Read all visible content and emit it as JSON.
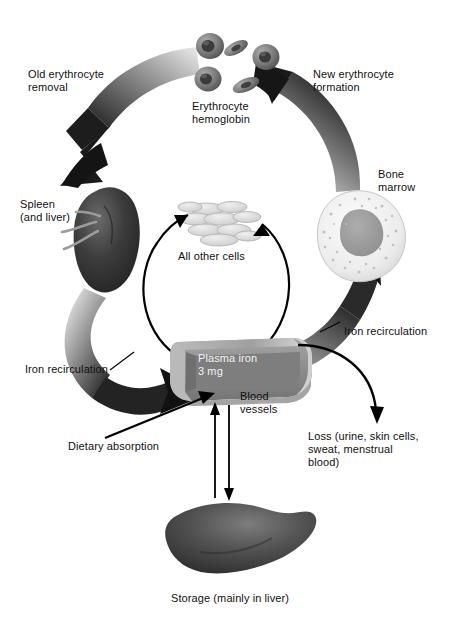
{
  "figure": {
    "background_color": "#ffffff",
    "text_color": "#111111",
    "width": 458,
    "height": 623
  },
  "labels": {
    "old_erythrocyte_removal": "Old erythrocyte\nremoval",
    "new_erythrocyte_formation": "New erythrocyte\nformation",
    "erythrocyte_hemoglobin": "Erythrocyte\nhemoglobin",
    "bone_marrow": "Bone\nmarrow",
    "spleen_and_liver": "Spleen\n(and liver)",
    "all_other_cells": "All other cells",
    "iron_recirculation_left": "Iron recirculation",
    "iron_recirculation_right": "Iron recirculation",
    "plasma_iron": "Plasma iron\n3 mg",
    "blood_vessels": "Blood\nvessels",
    "dietary_absorption": "Dietary absorption",
    "loss": "Loss (urine, skin cells,\nsweat, menstrual\nblood)",
    "storage": "Storage (mainly in liver)"
  },
  "structures": [
    {
      "name": "erythrocyte-hemoglobin",
      "type": "red-blood-cells",
      "count": 5,
      "color": "#6e6e6e"
    },
    {
      "name": "spleen",
      "type": "organ",
      "color": "#3a3a3a"
    },
    {
      "name": "bone-marrow",
      "type": "cell",
      "color": "#ededed",
      "nucleus_color": "#9a9a9a"
    },
    {
      "name": "all-other-cells",
      "type": "cell-cluster",
      "color": "#d8d8d8"
    },
    {
      "name": "blood-vessel",
      "type": "vessel-cutaway",
      "color": "#8c8c8c"
    },
    {
      "name": "liver",
      "type": "organ",
      "color": "#4a4a4a"
    }
  ],
  "flows": [
    {
      "name": "old-erythrocyte-removal",
      "from": "erythrocyte-hemoglobin",
      "to": "spleen",
      "style": "thick-gradient-arc"
    },
    {
      "name": "new-erythrocyte-formation",
      "from": "bone-marrow",
      "to": "erythrocyte-hemoglobin",
      "style": "thick-gradient-arc"
    },
    {
      "name": "iron-recirculation-spleen-to-plasma",
      "from": "spleen",
      "to": "blood-vessel",
      "style": "thick-gradient-arc"
    },
    {
      "name": "iron-recirculation-plasma-to-marrow",
      "from": "blood-vessel",
      "to": "bone-marrow",
      "style": "thick-gradient-arc"
    },
    {
      "name": "plasma-to-other-cells",
      "from": "blood-vessel",
      "to": "all-other-cells",
      "style": "thin-arc"
    },
    {
      "name": "other-cells-to-plasma",
      "from": "all-other-cells",
      "to": "blood-vessel",
      "style": "thin-arc"
    },
    {
      "name": "dietary-absorption",
      "from": "diet",
      "to": "blood-vessel",
      "style": "straight-arrow"
    },
    {
      "name": "iron-loss",
      "from": "blood-vessel",
      "to": "loss",
      "style": "thin-curve-arrow"
    },
    {
      "name": "liver-to-plasma",
      "from": "liver",
      "to": "blood-vessel",
      "style": "thin-line-up"
    },
    {
      "name": "plasma-to-liver",
      "from": "blood-vessel",
      "to": "liver",
      "style": "thin-line-down"
    }
  ],
  "colors": {
    "ink": "#111111",
    "arrow_dark": "#1c1c1c",
    "arrow_mid": "#767676",
    "arrow_light": "#e3e3e3",
    "vessel": "#8c8c8c",
    "vessel_light": "#b8b8b8",
    "vessel_dark": "#6d6d6d"
  }
}
